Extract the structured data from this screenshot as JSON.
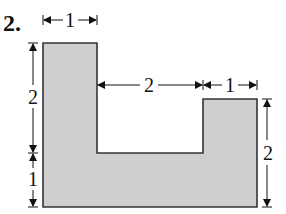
{
  "problem": {
    "number": "2."
  },
  "figure": {
    "shape": "U-shaped polygon (shaded)",
    "fill_color": "#cfcfcf",
    "stroke_color": "#333333",
    "dimensions": {
      "top_left_width": "1",
      "gap_width": "2",
      "top_right_width": "1",
      "left_upper_height": "2",
      "left_lower_height": "1",
      "right_height": "2"
    }
  }
}
